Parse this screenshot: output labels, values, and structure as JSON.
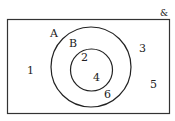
{
  "diagram": {
    "type": "venn",
    "universal_label": "&",
    "sets": [
      {
        "name": "A",
        "label": "A"
      },
      {
        "name": "B",
        "label": "B",
        "subset_of": "A"
      }
    ],
    "regions": {
      "outside": [
        "1",
        "3",
        "5"
      ],
      "A_only": [
        "6"
      ],
      "B": [
        "2",
        "4"
      ]
    },
    "labels": {
      "set_a": "A",
      "set_b": "B",
      "el_1": "1",
      "el_2": "2",
      "el_3": "3",
      "el_4": "4",
      "el_5": "5",
      "el_6": "6"
    },
    "colors": {
      "stroke": "#222222",
      "background": "#ffffff"
    }
  }
}
